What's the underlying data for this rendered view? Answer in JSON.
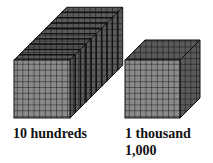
{
  "left": {
    "label": "10 hundreds",
    "flat_count": 10
  },
  "right": {
    "label": "1 thousand",
    "value": "1,000"
  },
  "colors": {
    "face": "#8a8a8a",
    "top": "#555555",
    "side": "#6e6e6e",
    "grid": "#1a1a1a"
  }
}
